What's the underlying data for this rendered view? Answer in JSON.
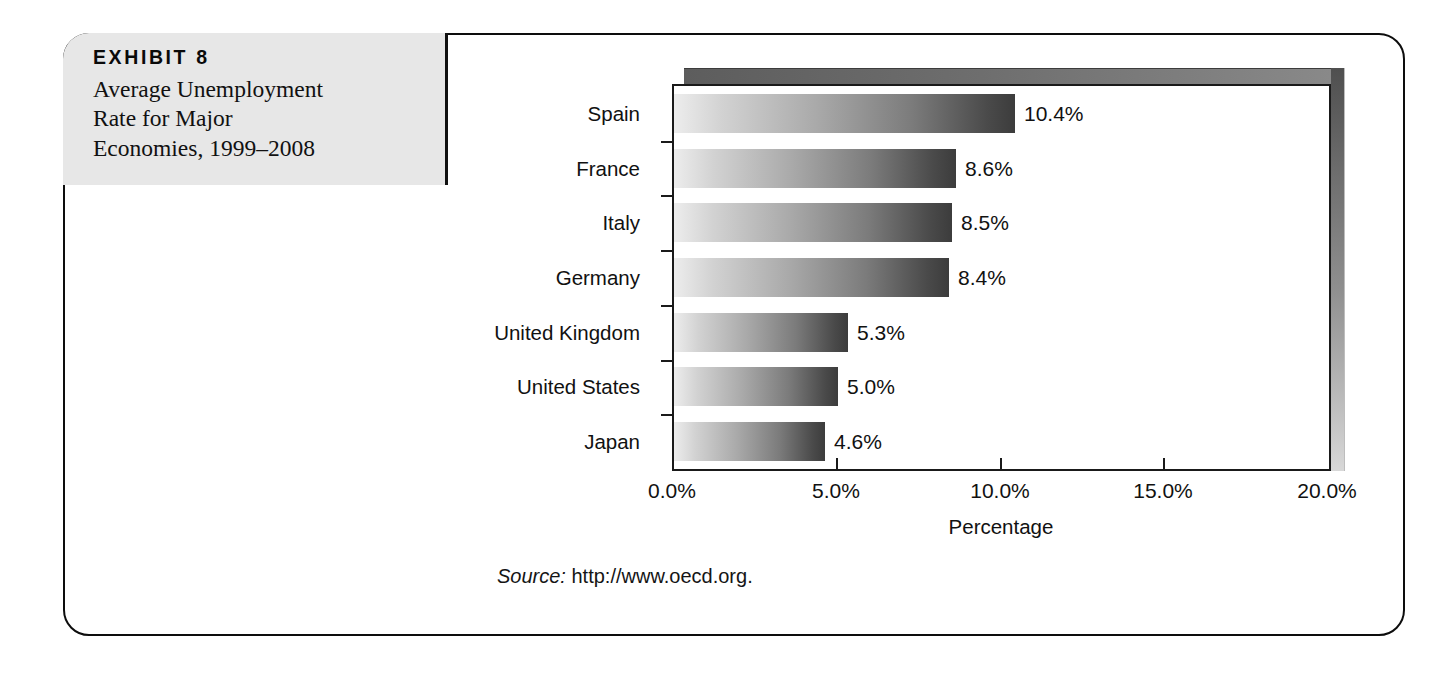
{
  "exhibit": {
    "label": "EXHIBIT 8",
    "title_lines": [
      "Average Unemployment",
      "Rate for Major",
      "Economies, 1999–2008"
    ]
  },
  "source": {
    "label": "Source:",
    "text": "http://www.oecd.org."
  },
  "chart_data": {
    "type": "bar",
    "orientation": "horizontal",
    "title": "Average Unemployment Rate for Major Economies, 1999–2008",
    "categories": [
      "Spain",
      "France",
      "Italy",
      "Germany",
      "United Kingdom",
      "United States",
      "Japan"
    ],
    "values": [
      10.4,
      8.6,
      8.5,
      8.4,
      5.3,
      5.0,
      4.6
    ],
    "value_labels": [
      "10.4%",
      "8.6%",
      "8.5%",
      "8.4%",
      "5.3%",
      "5.0%",
      "4.6%"
    ],
    "xlabel": "Percentage",
    "ylabel": "",
    "xlim": [
      0,
      20
    ],
    "xticks": [
      0,
      5,
      10,
      15,
      20
    ],
    "xtick_labels": [
      "0.0%",
      "5.0%",
      "10.0%",
      "15.0%",
      "20.0%"
    ],
    "grid": false,
    "legend": false,
    "bar_gradient_start": "#ededed",
    "bar_gradient_end": "#3c3c3c",
    "frame_color": "#1a1a1a"
  }
}
